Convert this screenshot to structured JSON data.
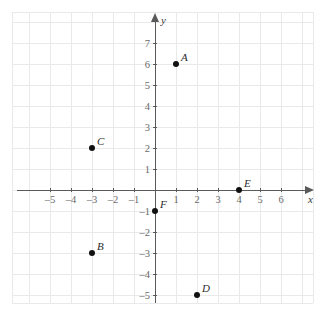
{
  "chart_data": {
    "type": "scatter",
    "title": "",
    "xlabel": "x",
    "ylabel": "y",
    "xlim": [
      -6.8,
      7.5
    ],
    "ylim": [
      -6.0,
      8.4
    ],
    "grid": true,
    "legend": "none",
    "x_ticks": [
      -5,
      -4,
      -3,
      -2,
      -1,
      1,
      2,
      3,
      4,
      5,
      6
    ],
    "y_ticks": [
      7,
      6,
      5,
      4,
      3,
      2,
      1,
      -1,
      -2,
      -3,
      -4,
      -5
    ],
    "x_tick_labels": [
      "–5",
      "–4",
      "–3",
      "–2",
      "–1",
      "1",
      "2",
      "3",
      "4",
      "5",
      "6"
    ],
    "y_tick_labels": [
      "7",
      "6",
      "5",
      "4",
      "3",
      "2",
      "1",
      "–1",
      "–2",
      "–3",
      "–4",
      "–5"
    ],
    "points": [
      {
        "label": "A",
        "x": 1,
        "y": 6
      },
      {
        "label": "B",
        "x": -3,
        "y": -3
      },
      {
        "label": "C",
        "x": -3,
        "y": 2
      },
      {
        "label": "D",
        "x": 2,
        "y": -5
      },
      {
        "label": "E",
        "x": 4,
        "y": 0
      },
      {
        "label": "F",
        "x": 0,
        "y": -1
      }
    ]
  },
  "colors": {
    "background": "#ffffff",
    "grid": "#e9e9e9",
    "axis": "#5a5a5a",
    "point": "#111111",
    "tick_text": "#6b6b6b",
    "label_text": "#2b2b2b"
  }
}
